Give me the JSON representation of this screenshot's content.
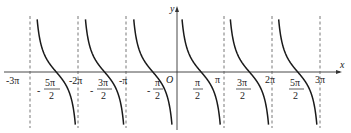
{
  "chart_data": {
    "type": "line",
    "title": "",
    "function": "y = cot x",
    "xlabel": "x",
    "ylabel": "y",
    "origin_label": "O",
    "xlim": [
      -3.14159,
      3.14159
    ],
    "x_range_label": [
      "-3π",
      "3π"
    ],
    "asymptotes": [
      "-3π",
      "-2π",
      "-π",
      "π",
      "2π",
      "3π"
    ],
    "asymptote_style": "dashed",
    "grid": false,
    "legend": null,
    "x_ticks_above": [
      {
        "label": "-3π",
        "value": -3
      },
      {
        "label": "-2π",
        "value": -2
      },
      {
        "label": "-π",
        "value": -1
      },
      {
        "label": "π",
        "value": 1
      },
      {
        "label": "2π",
        "value": 2
      },
      {
        "label": "3π",
        "value": 3
      }
    ],
    "x_ticks_fraction": [
      {
        "sign": "-",
        "num": "5π",
        "den": "2",
        "value": -2.5
      },
      {
        "sign": "-",
        "num": "3π",
        "den": "2",
        "value": -1.5
      },
      {
        "sign": "-",
        "num": "π",
        "den": "2",
        "value": -0.5
      },
      {
        "sign": "",
        "num": "π",
        "den": "2",
        "value": 0.5
      },
      {
        "sign": "",
        "num": "3π",
        "den": "2",
        "value": 1.5
      },
      {
        "sign": "",
        "num": "5π",
        "den": "2",
        "value": 2.5
      }
    ],
    "series": [
      {
        "name": "cot x",
        "branches": [
          {
            "from": "-3π",
            "to": "-2π",
            "zero": "-5π/2"
          },
          {
            "from": "-2π",
            "to": "-π",
            "zero": "-3π/2"
          },
          {
            "from": "-π",
            "to": "0",
            "zero": "-π/2"
          },
          {
            "from": "0",
            "to": "π",
            "zero": "π/2"
          },
          {
            "from": "π",
            "to": "2π",
            "zero": "3π/2"
          },
          {
            "from": "2π",
            "to": "3π",
            "zero": "5π/2"
          }
        ]
      }
    ]
  },
  "labels": {
    "x_axis": "x",
    "y_axis": "y",
    "origin": "O",
    "neg3pi": "-3π",
    "neg2pi": "-2π",
    "negpi": "-π",
    "pi": "π",
    "twopi": "2π",
    "threepi": "3π",
    "frac_num_5pi": "5π",
    "frac_num_3pi": "3π",
    "frac_num_pi": "π",
    "frac_den_2": "2",
    "minus": "-"
  },
  "colors": {
    "curve": "#1a1a1a",
    "axis": "#333333",
    "asymptote": "#555555",
    "background": "#ffffff"
  }
}
